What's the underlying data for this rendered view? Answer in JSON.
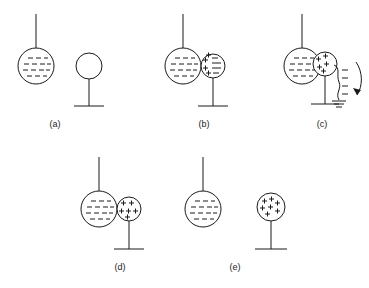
{
  "figure": {
    "background_color": "#ffffff",
    "line_color": "#1a1a1a",
    "label_font_size": 9,
    "panels": [
      {
        "id": "a",
        "label": "(a)",
        "label_x": 55,
        "label_y": 127,
        "description": "Negatively charged hanging sphere near a neutral sphere on an insulating stand",
        "hanging_sphere": {
          "name": "charged-rod-sphere",
          "cx": 36,
          "cy": 66,
          "r": 18,
          "thread_top_y": 14,
          "charge_sign": "negative",
          "charge_rows": [
            3,
            4,
            4,
            3
          ]
        },
        "stand_sphere": {
          "name": "neutral-sphere",
          "cx": 89,
          "cy": 66,
          "r": 13,
          "charge_sign": "none",
          "post_bottom_y": 106,
          "base_half_width": 15
        }
      },
      {
        "id": "b",
        "label": "(b)",
        "label_x": 204,
        "label_y": 127,
        "description": "Neutral sphere polarized by induction: positive charges on near side, negative on far side",
        "hanging_sphere": {
          "name": "charged-rod-sphere",
          "cx": 183,
          "cy": 66,
          "r": 18,
          "thread_top_y": 14,
          "charge_sign": "negative",
          "charge_rows": [
            3,
            4,
            4,
            3
          ]
        },
        "stand_sphere": {
          "name": "polarized-sphere",
          "cx": 213,
          "cy": 66,
          "r": 12,
          "charge_sign": "polarized",
          "positive_count": 4,
          "negative_count": 4,
          "post_bottom_y": 106,
          "base_half_width": 15
        }
      },
      {
        "id": "c",
        "label": "(c)",
        "label_x": 322,
        "label_y": 127,
        "description": "Grounding wire attached: electrons flow from the sphere to ground",
        "hanging_sphere": {
          "name": "charged-rod-sphere",
          "cx": 302,
          "cy": 66,
          "r": 18,
          "thread_top_y": 14,
          "charge_sign": "negative",
          "charge_rows": [
            3,
            4,
            4,
            3
          ]
        },
        "stand_sphere": {
          "name": "grounded-sphere",
          "cx": 325,
          "cy": 64,
          "r": 12,
          "charge_sign": "positive",
          "positive_count": 5,
          "post_bottom_y": 104,
          "base_half_width": 14
        },
        "ground_wire": {
          "name": "ground-wire",
          "electron_marks": 4,
          "ground_symbol_bars": 3
        },
        "flow_arrow": {
          "name": "electron-flow-arrow",
          "direction": "downward"
        }
      },
      {
        "id": "d",
        "label": "(d)",
        "label_x": 120,
        "label_y": 270,
        "description": "Ground removed: sphere retains a net positive charge concentrated near the charged sphere",
        "hanging_sphere": {
          "name": "charged-rod-sphere",
          "cx": 99,
          "cy": 209,
          "r": 18,
          "thread_top_y": 157,
          "charge_sign": "negative",
          "charge_rows": [
            3,
            4,
            4,
            3
          ]
        },
        "stand_sphere": {
          "name": "positively-charged-sphere",
          "cx": 129,
          "cy": 209,
          "r": 12,
          "charge_sign": "positive",
          "positive_count": 6,
          "post_bottom_y": 249,
          "base_half_width": 15
        }
      },
      {
        "id": "e",
        "label": "(e)",
        "label_x": 235,
        "label_y": 270,
        "description": "Charged sphere removed: positive charge spreads uniformly over the sphere",
        "hanging_sphere": {
          "name": "charged-rod-sphere",
          "cx": 203,
          "cy": 209,
          "r": 18,
          "thread_top_y": 157,
          "charge_sign": "negative",
          "charge_rows": [
            3,
            4,
            4,
            3
          ]
        },
        "stand_sphere": {
          "name": "uniformly-charged-sphere",
          "cx": 271,
          "cy": 207,
          "r": 14,
          "charge_sign": "positive",
          "positive_count": 7,
          "post_bottom_y": 249,
          "base_half_width": 16
        }
      }
    ]
  }
}
